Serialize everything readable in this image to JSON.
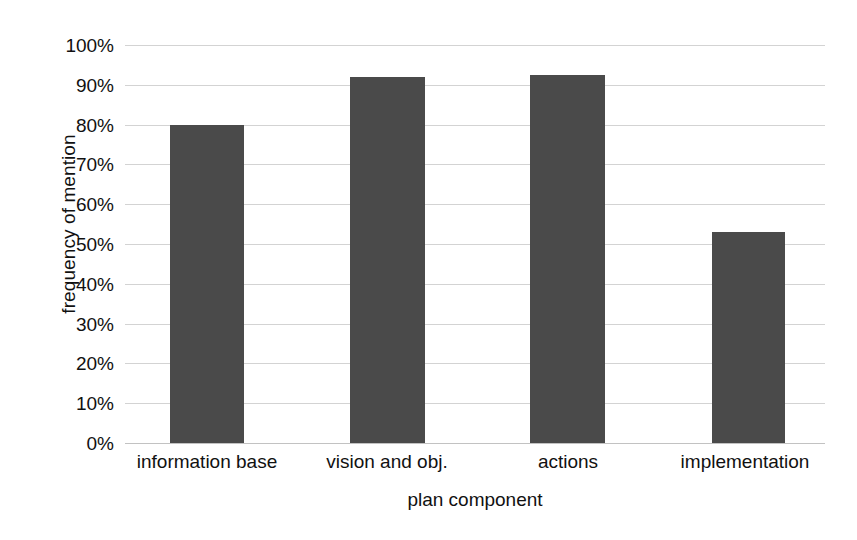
{
  "chart_data": {
    "type": "bar",
    "title": "",
    "subtitle": "",
    "xlabel": "plan component",
    "ylabel": "frequency of mention",
    "categories": [
      "information base",
      "vision and obj.",
      "actions",
      "implementation"
    ],
    "values": [
      80,
      92,
      92.5,
      53
    ],
    "ylim": [
      0,
      100
    ],
    "ytick_labels": [
      "100%",
      "90%",
      "80%",
      "70%",
      "60%",
      "50%",
      "40%",
      "30%",
      "20%",
      "10%",
      "0%"
    ],
    "ytick_values": [
      100,
      90,
      80,
      70,
      60,
      50,
      40,
      30,
      20,
      10,
      0
    ],
    "grid": true,
    "grid_axis": "y",
    "legend": false,
    "legend_position": "none",
    "series": [
      {
        "name": "frequency of mention",
        "values": [
          80,
          92,
          92.5,
          53
        ]
      }
    ],
    "colors": {
      "bar_fill": "#4a4a4a",
      "gridline": "#d3d3d3",
      "axis_line": "#c2c2c2",
      "text": "#111111",
      "background": "#ffffff"
    }
  }
}
